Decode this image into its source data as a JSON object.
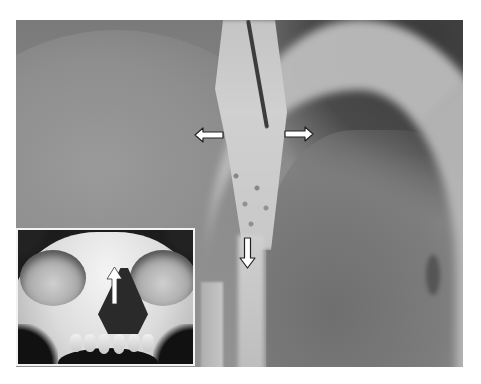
{
  "figure": {
    "colors": {
      "background": "#ffffff",
      "arrow_fill": "#ffffff",
      "arrow_outline": "#222222",
      "inset_border": "#f2f2f2"
    },
    "main_photo": {
      "arrows": [
        {
          "id": "arrow-left",
          "direction": "left"
        },
        {
          "id": "arrow-right",
          "direction": "right"
        },
        {
          "id": "arrow-down",
          "direction": "down"
        }
      ]
    },
    "inset": {
      "subject": "frontal view of skull",
      "arrows": [
        {
          "id": "inset-arrow-up",
          "direction": "up"
        }
      ]
    }
  }
}
